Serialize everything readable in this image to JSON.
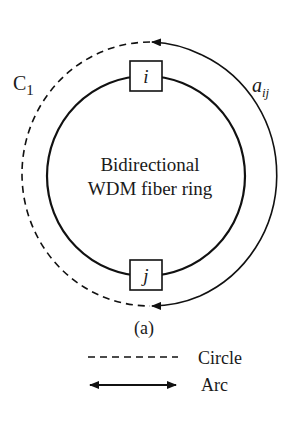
{
  "diagram": {
    "center_label_line1": "Bidirectional",
    "center_label_line2": "WDM fiber ring",
    "node_top": "i",
    "node_bottom": "j",
    "circle_label": "C",
    "circle_label_sub": "1",
    "arc_label": "a",
    "arc_label_sub": "ij",
    "caption": "(a)",
    "colors": {
      "stroke": "#111111",
      "background": "#ffffff"
    }
  },
  "legend": {
    "items": [
      {
        "style": "dashed",
        "label": "Circle"
      },
      {
        "style": "double-arrow",
        "label": "Arc"
      }
    ]
  }
}
